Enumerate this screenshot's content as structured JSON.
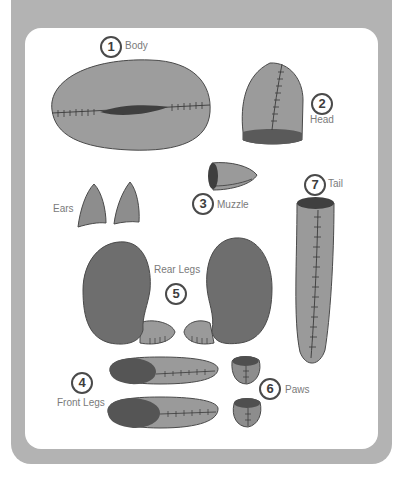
{
  "diagram": {
    "style": "grayscale sewing pattern pieces for a plush animal",
    "colors": {
      "frame": "#b3b3b3",
      "card": "#ffffff",
      "piece_light": "#9a9a9a",
      "piece_dark": "#6e6e6e",
      "piece_darker": "#4f4f4f",
      "stitch": "#3a3a3a",
      "label_text": "#7a7a7a",
      "number_text": "#3d3d3d"
    },
    "parts": [
      {
        "number": "1",
        "label": "Body"
      },
      {
        "number": "2",
        "label": "Head"
      },
      {
        "number": "3",
        "label": "Muzzle"
      },
      {
        "number": "",
        "label": "Ears"
      },
      {
        "number": "7",
        "label": "Tail"
      },
      {
        "number": "5",
        "label": "Rear Legs"
      },
      {
        "number": "4",
        "label": "Front Legs"
      },
      {
        "number": "6",
        "label": "Paws"
      }
    ]
  }
}
